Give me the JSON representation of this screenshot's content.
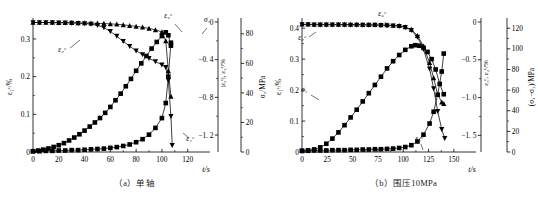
{
  "figure": {
    "background": "#ffffff",
    "axis_color": "#000000",
    "marker_color": "#000000",
    "line_color": "#000000"
  },
  "panels": [
    {
      "id": "a",
      "caption": "（a）单轴",
      "xlabel": "t/s",
      "ylabel_left": "ε₁ᶜ/%",
      "ylabel_mid": "|ε₃ᶜ|, ε₂ᶜ/%",
      "ylabel_right": "σ₁/MPa",
      "x_ticks": [
        "0",
        "20",
        "40",
        "60",
        "80",
        "100",
        "120"
      ],
      "x_tick_values": [
        0,
        20,
        40,
        60,
        80,
        100,
        120
      ],
      "y_left_ticks": [
        "0",
        "0.1",
        "0.2",
        "0.3"
      ],
      "y_left_tick_values": [
        0,
        0.1,
        0.2,
        0.3
      ],
      "y_mid_ticks": [
        "0",
        "−0. 4",
        "−0. 8",
        "−1. 2"
      ],
      "y_mid_tick_values": [
        0,
        -0.4,
        -0.8,
        -1.2
      ],
      "y_right_ticks": [
        "0",
        "20",
        "40",
        "60",
        "80"
      ],
      "y_right_tick_values": [
        0,
        20,
        40,
        60,
        80
      ],
      "curve_labels": [
        {
          "name": "eps3c",
          "text": "ε₃ᶜ"
        },
        {
          "name": "eps2c",
          "text": "ε₂ᶜ"
        },
        {
          "name": "sigma1",
          "text": "σ₁"
        },
        {
          "name": "eps1c",
          "text": "ε₁ᶜ"
        }
      ]
    },
    {
      "id": "b",
      "caption": "（b）围压10MPa",
      "xlabel": "t/s",
      "ylabel_left": "ε₁ᶜ/%",
      "ylabel_mid": "ε₃ᶜ, ε₂ᶜ/%",
      "ylabel_right": "(σ₁−σ₃)/MPa",
      "x_ticks": [
        "0",
        "25",
        "50",
        "75",
        "100",
        "125",
        "150"
      ],
      "x_tick_values": [
        0,
        25,
        50,
        75,
        100,
        125,
        150
      ],
      "y_left_ticks": [
        "0",
        "0.1",
        "0.2",
        "0.3",
        "0.4"
      ],
      "y_left_tick_values": [
        0,
        0.1,
        0.2,
        0.3,
        0.4
      ],
      "y_mid_ticks": [
        "0",
        "−0. 5",
        "−1. 0",
        "−1. 5"
      ],
      "y_mid_tick_values": [
        0,
        -0.5,
        -1.0,
        -1.5
      ],
      "y_right_ticks": [
        "0",
        "20",
        "40",
        "60",
        "80",
        "100",
        "120"
      ],
      "y_right_tick_values": [
        0,
        20,
        40,
        60,
        80,
        100,
        120
      ],
      "curve_labels": [
        {
          "name": "eps3c",
          "text": "ε₃ᶜ"
        },
        {
          "name": "eps2c",
          "text": "ε₂ᶜ"
        },
        {
          "name": "sigma1",
          "text": "σ₁"
        },
        {
          "name": "eps1c",
          "text": "ε₁ᶜ"
        }
      ]
    }
  ],
  "chart_data": [
    {
      "type": "line",
      "panel": "a",
      "title": "（a）单轴",
      "xlabel": "t/s",
      "ylabel": "ε₁ᶜ/%",
      "ylabel_secondary": "|ε₃ᶜ|, ε₂ᶜ/%",
      "ylabel_tertiary": "σ₁/MPa",
      "xlim": [
        0,
        128
      ],
      "ylim": [
        0,
        0.345
      ],
      "ylim_secondary": [
        -1.38,
        0
      ],
      "ylim_tertiary": [
        0,
        88
      ],
      "grid": false,
      "legend": "inline-annotations",
      "series": [
        {
          "name": "ε₃ᶜ",
          "axis": "secondary",
          "marker": "triangle-up",
          "x": [
            0,
            5,
            10,
            15,
            20,
            25,
            30,
            35,
            40,
            45,
            50,
            55,
            60,
            65,
            70,
            75,
            80,
            85,
            90,
            95,
            100,
            103,
            105,
            107
          ],
          "y": [
            -0.005,
            -0.005,
            -0.006,
            -0.006,
            -0.007,
            -0.007,
            -0.008,
            -0.009,
            -0.01,
            -0.012,
            -0.014,
            -0.016,
            -0.02,
            -0.024,
            -0.03,
            -0.038,
            -0.046,
            -0.056,
            -0.068,
            -0.084,
            -0.105,
            -0.2,
            -0.52,
            -0.79
          ]
        },
        {
          "name": "ε₂ᶜ",
          "axis": "secondary",
          "marker": "triangle-down",
          "x": [
            0,
            5,
            10,
            15,
            20,
            25,
            30,
            35,
            40,
            45,
            50,
            55,
            60,
            65,
            70,
            75,
            80,
            85,
            90,
            95,
            100,
            103,
            105,
            107,
            108
          ],
          "y": [
            -0.005,
            -0.005,
            -0.006,
            -0.007,
            -0.008,
            -0.009,
            -0.011,
            -0.013,
            -0.016,
            -0.022,
            -0.034,
            -0.06,
            -0.1,
            -0.15,
            -0.205,
            -0.258,
            -0.305,
            -0.345,
            -0.385,
            -0.42,
            -0.455,
            -0.48,
            -0.62,
            -1.0,
            -1.31
          ]
        },
        {
          "name": "σ₁",
          "axis": "tertiary",
          "marker": "square",
          "x": [
            0,
            4,
            8,
            12,
            16,
            20,
            24,
            28,
            32,
            36,
            40,
            44,
            48,
            52,
            56,
            60,
            64,
            68,
            72,
            76,
            80,
            84,
            88,
            92,
            96,
            100,
            103,
            105,
            107
          ],
          "y": [
            0.5,
            1.0,
            1.6,
            2.4,
            3.4,
            4.6,
            6.0,
            7.8,
            9.8,
            12.0,
            14.5,
            17.2,
            20.0,
            23.0,
            26.5,
            30.5,
            35.0,
            39.5,
            44.5,
            49.5,
            55.0,
            60.0,
            65.0,
            70.0,
            74.5,
            78.5,
            81.0,
            79.0,
            72.0
          ]
        },
        {
          "name": "ε₁ᶜ",
          "axis": "left",
          "marker": "square",
          "x": [
            0,
            5,
            10,
            15,
            20,
            25,
            30,
            35,
            40,
            45,
            50,
            55,
            60,
            65,
            70,
            75,
            80,
            85,
            90,
            95,
            100,
            103,
            105,
            107
          ],
          "y": [
            0.002,
            0.002,
            0.003,
            0.003,
            0.004,
            0.004,
            0.005,
            0.005,
            0.006,
            0.007,
            0.008,
            0.009,
            0.011,
            0.013,
            0.016,
            0.02,
            0.026,
            0.034,
            0.046,
            0.064,
            0.09,
            0.13,
            0.2,
            0.29
          ]
        }
      ]
    },
    {
      "type": "line",
      "panel": "b",
      "title": "（b）围压10MPa",
      "xlabel": "t/s",
      "ylabel": "ε₁ᶜ/%",
      "ylabel_secondary": "ε₃ᶜ, ε₂ᶜ/%",
      "ylabel_tertiary": "(σ₁−σ₃)/MPa",
      "xlim": [
        0,
        160
      ],
      "ylim": [
        0,
        0.42
      ],
      "ylim_secondary": [
        -1.72,
        0
      ],
      "ylim_tertiary": [
        0,
        126
      ],
      "grid": false,
      "legend": "inline-annotations",
      "series": [
        {
          "name": "ε₃ᶜ",
          "axis": "secondary",
          "marker": "triangle-down",
          "x": [
            0,
            6,
            12,
            18,
            24,
            30,
            36,
            42,
            48,
            54,
            60,
            66,
            72,
            78,
            84,
            90,
            96,
            102,
            108,
            114,
            120,
            126,
            130,
            134,
            138,
            141
          ],
          "y": [
            -0.035,
            -0.035,
            -0.036,
            -0.036,
            -0.037,
            -0.037,
            -0.038,
            -0.038,
            -0.039,
            -0.039,
            -0.04,
            -0.041,
            -0.042,
            -0.044,
            -0.046,
            -0.05,
            -0.056,
            -0.07,
            -0.11,
            -0.2,
            -0.36,
            -0.62,
            -0.88,
            -1.18,
            -1.42,
            -1.54
          ]
        },
        {
          "name": "ε₂ᶜ",
          "axis": "secondary",
          "marker": "triangle-up",
          "x": [
            0,
            6,
            12,
            18,
            24,
            30,
            36,
            42,
            48,
            54,
            60,
            66,
            72,
            78,
            84,
            90,
            96,
            102,
            108,
            114,
            120,
            126,
            130,
            134,
            138,
            140
          ],
          "y": [
            -0.03,
            -0.03,
            -0.031,
            -0.031,
            -0.032,
            -0.032,
            -0.033,
            -0.033,
            -0.034,
            -0.034,
            -0.035,
            -0.036,
            -0.037,
            -0.038,
            -0.04,
            -0.044,
            -0.05,
            -0.064,
            -0.1,
            -0.18,
            -0.32,
            -0.54,
            -0.74,
            -0.96,
            -1.06,
            -1.08
          ]
        },
        {
          "name": "σ₁",
          "axis": "tertiary",
          "marker": "square",
          "x": [
            0,
            6,
            12,
            18,
            24,
            30,
            36,
            42,
            48,
            54,
            60,
            66,
            72,
            78,
            84,
            90,
            96,
            102,
            108,
            112,
            116,
            120,
            124,
            128,
            132,
            136,
            140
          ],
          "y": [
            1.0,
            1.5,
            2.5,
            4.5,
            8.0,
            13.0,
            19.0,
            26.0,
            33.5,
            41.0,
            49.0,
            57.0,
            65.0,
            73.0,
            81.0,
            88.0,
            94.0,
            99.0,
            102.5,
            103.5,
            103.0,
            101.0,
            97.0,
            90.0,
            80.0,
            66.0,
            56.0
          ]
        },
        {
          "name": "ε₁ᶜ",
          "axis": "left",
          "marker": "square",
          "x": [
            0,
            6,
            12,
            18,
            24,
            30,
            36,
            42,
            48,
            54,
            60,
            66,
            72,
            78,
            84,
            90,
            96,
            102,
            108,
            114,
            120,
            126,
            130,
            134,
            138,
            140
          ],
          "y": [
            0.004,
            0.004,
            0.005,
            0.005,
            0.005,
            0.006,
            0.006,
            0.006,
            0.007,
            0.007,
            0.008,
            0.008,
            0.009,
            0.009,
            0.01,
            0.011,
            0.013,
            0.016,
            0.022,
            0.034,
            0.056,
            0.092,
            0.13,
            0.185,
            0.26,
            0.318
          ]
        }
      ]
    }
  ]
}
